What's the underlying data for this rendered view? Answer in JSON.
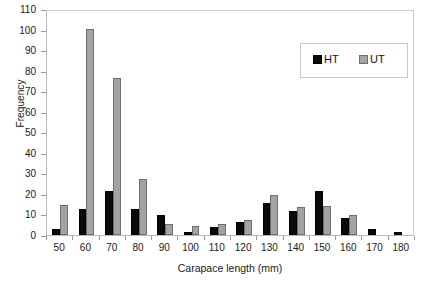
{
  "chart_data": {
    "type": "bar",
    "title": "",
    "xlabel": "Carapace length (mm)",
    "ylabel": "Frequency",
    "categories": [
      "50",
      "60",
      "70",
      "80",
      "90",
      "100",
      "110",
      "120",
      "130",
      "140",
      "150",
      "160",
      "170",
      "180"
    ],
    "series": [
      {
        "name": "HT",
        "color": "#0a0a0a",
        "values": [
          3,
          12.5,
          21.5,
          12.5,
          9.5,
          1.5,
          4,
          6.5,
          15.5,
          11.5,
          21.5,
          8.5,
          3,
          1.5
        ]
      },
      {
        "name": "UT",
        "color": "#a3a3a3",
        "values": [
          14.5,
          100.5,
          76.5,
          27.5,
          5.5,
          4.5,
          5.5,
          7.5,
          19.5,
          13.5,
          14,
          9.5,
          0,
          0
        ]
      }
    ],
    "ylim": [
      0,
      110
    ],
    "yticks": [
      0,
      10,
      20,
      30,
      40,
      50,
      60,
      70,
      80,
      90,
      100,
      110
    ],
    "grid": false,
    "legend_position": "upper-right",
    "legend_entries": [
      "HT",
      "UT"
    ]
  },
  "axes": {
    "y_title": "Frequency",
    "x_title": "Carapace length (mm)"
  }
}
